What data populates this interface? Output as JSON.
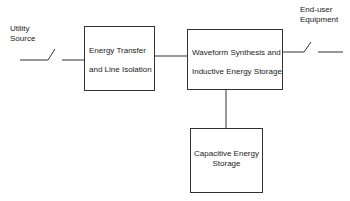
{
  "diagram": {
    "nodes": [
      {
        "id": "utility-source",
        "label_line1": "Utility",
        "label_line2": "Source"
      },
      {
        "id": "energy-transfer",
        "label_line1": "Energy Transfer",
        "label_line2": "and Line Isolation"
      },
      {
        "id": "waveform-synthesis",
        "label_line1": "Waveform Synthesis and",
        "label_line2": "Inductive Energy Storage"
      },
      {
        "id": "capacitive-storage",
        "label_line1": "Capacitive Energy",
        "label_line2": "Storage"
      },
      {
        "id": "end-user",
        "label_line1": "End-user",
        "label_line2": "Equipment"
      }
    ],
    "edges": [
      {
        "from": "utility-source",
        "to": "energy-transfer",
        "via": "switch"
      },
      {
        "from": "energy-transfer",
        "to": "waveform-synthesis"
      },
      {
        "from": "waveform-synthesis",
        "to": "end-user",
        "via": "switch"
      },
      {
        "from": "waveform-synthesis",
        "to": "capacitive-storage"
      }
    ],
    "colors": {
      "line": "#333333",
      "background": "#ffffff"
    }
  }
}
